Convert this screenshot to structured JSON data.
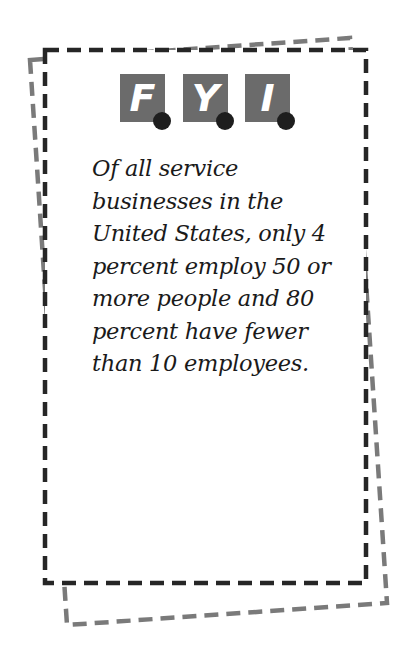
{
  "header": {
    "letters": [
      "F",
      "Y",
      "I"
    ]
  },
  "fact": {
    "lines": [
      "Of all service",
      "businesses in the",
      "United States, only 4",
      "percent employ 50 or",
      "more people and 80",
      "percent have fewer",
      "than 10 employees."
    ]
  },
  "colors": {
    "tile": "#6b6b6b",
    "dot": "#1e1e1e",
    "front_border": "#262626",
    "back_border": "#7a7a7a"
  }
}
